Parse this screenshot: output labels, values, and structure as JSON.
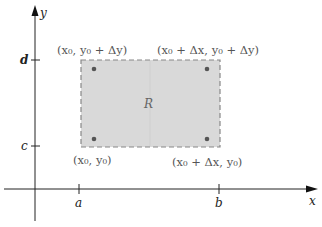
{
  "diagram": {
    "axes": {
      "x_label": "x",
      "y_label": "y",
      "x_ticks": [
        {
          "label": "a"
        },
        {
          "label": "b"
        }
      ],
      "y_ticks": [
        {
          "label": "d"
        },
        {
          "label": "c"
        }
      ]
    },
    "region": {
      "label": "R",
      "fill": "#d9d9d9",
      "border": "dashed"
    },
    "corners": {
      "top_left": {
        "x": "x",
        "xs": "0",
        "mid": ", ",
        "y": "y",
        "ys": "0",
        "tail": " + Δy)"
      },
      "top_right": {
        "text": "(x₀ + Δx, y₀ + Δy)"
      },
      "bottom_left": {
        "text": "(x₀, y₀)"
      },
      "bottom_right": {
        "text": "(x₀ + Δx, y₀)"
      }
    },
    "labels": {
      "top_left": "(x₀, y₀ + Δy)",
      "top_right": "(x₀ + Δx, y₀ + Δy)",
      "bottom_left": "(x₀, y₀)",
      "bottom_right": "(x₀ + Δx, y₀)"
    }
  }
}
